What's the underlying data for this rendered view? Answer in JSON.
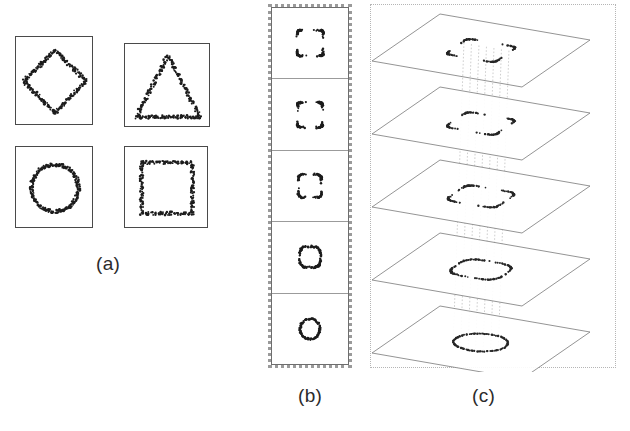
{
  "figure": {
    "caption_labels": {
      "a": "(a)",
      "b": "(b)",
      "c": "(c)"
    }
  },
  "panel_a": {
    "name": "input-shape-samples",
    "boxes": [
      {
        "id": "box-diamond",
        "shape": "diamond",
        "label": "diamond",
        "x": 15,
        "y": 36,
        "w": 78,
        "h": 89
      },
      {
        "id": "box-triangle",
        "shape": "triangle",
        "label": "triangle",
        "x": 124,
        "y": 43,
        "w": 86,
        "h": 84
      },
      {
        "id": "box-circle",
        "shape": "circle",
        "label": "circle",
        "x": 15,
        "y": 146,
        "w": 78,
        "h": 82
      },
      {
        "id": "box-square",
        "shape": "square",
        "label": "square",
        "x": 124,
        "y": 146,
        "w": 84,
        "h": 82
      }
    ]
  },
  "panel_b": {
    "name": "morph-sequence-stack",
    "cell_count": 5,
    "cells": [
      {
        "index": 0,
        "shape": "square",
        "size": 26,
        "roundness": 0.18
      },
      {
        "index": 1,
        "shape": "square",
        "size": 25,
        "roundness": 0.3
      },
      {
        "index": 2,
        "shape": "rounded-square",
        "size": 23,
        "roundness": 0.52
      },
      {
        "index": 3,
        "shape": "circle",
        "size": 21,
        "roundness": 0.88
      },
      {
        "index": 4,
        "shape": "circle",
        "size": 20,
        "roundness": 1.0
      }
    ]
  },
  "panel_c": {
    "name": "stacked-planes-3d",
    "plane_count": 5,
    "planes": [
      {
        "index": 0,
        "shape": "square",
        "roundness": 0.18
      },
      {
        "index": 1,
        "shape": "square",
        "roundness": 0.32
      },
      {
        "index": 2,
        "shape": "rounded-square",
        "roundness": 0.55
      },
      {
        "index": 3,
        "shape": "circle",
        "roundness": 0.85
      },
      {
        "index": 4,
        "shape": "circle",
        "roundness": 1.0
      }
    ],
    "correspondence_lines": 7
  },
  "chart_data": {
    "type": "scatter",
    "title": "",
    "xlabel": "",
    "ylabel": "",
    "panels": [
      {
        "id": "a",
        "label": "(a)",
        "type": "scatter",
        "subplots": [
          "diamond",
          "triangle",
          "circle",
          "square"
        ],
        "n_subplots": 4,
        "grid": [
          2,
          2
        ]
      },
      {
        "id": "b",
        "label": "(b)",
        "type": "scatter",
        "sequence": [
          "square",
          "square",
          "rounded-square",
          "circle",
          "circle"
        ],
        "n_steps": 5
      },
      {
        "id": "c",
        "label": "(c)",
        "type": "scatter",
        "sequence": [
          "square",
          "square",
          "rounded-square",
          "circle",
          "circle"
        ],
        "n_planes": 5,
        "n_correspondence_lines": 7
      }
    ],
    "colors": {
      "points": "#1c1c1c",
      "box_border": "#4a4a4a",
      "plane_edge": "#787878",
      "correspondence": "#b9b9b9",
      "dotted_frame": "#9a9a9a"
    }
  }
}
